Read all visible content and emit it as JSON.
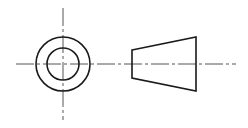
{
  "drawing": {
    "type": "orthographic-projection",
    "views": [
      {
        "name": "end-view",
        "shape": "concentric-circles",
        "center": [
          63,
          64
        ],
        "outer_radius": 27,
        "inner_radius": 16
      },
      {
        "name": "side-view",
        "shape": "frustum-trapezoid",
        "left_x": 132,
        "left_top": 50,
        "left_bottom": 78,
        "right_x": 196,
        "right_top": 37,
        "right_bottom": 91
      }
    ],
    "centerline_y": 64,
    "colors": {
      "line": "#1a1a1a",
      "centerline": "#555555",
      "background": "#ffffff"
    }
  }
}
